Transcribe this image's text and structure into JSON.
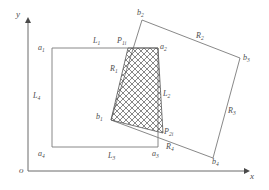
{
  "figure": {
    "type": "geometry-diagram",
    "colors": {
      "line": "#7a7a7a",
      "axis": "#6b6b6b",
      "hatch": "#555555",
      "label": "#4d4d4d",
      "background": "#ffffff"
    }
  },
  "axes": {
    "origin_label": "o",
    "x_label": "x",
    "y_label": "y"
  },
  "rect_a": {
    "name": "axis-aligned-rectangle",
    "vertices": [
      {
        "id": "a1",
        "label": "a",
        "sub": "1",
        "x": 52,
        "y": 48
      },
      {
        "id": "a2",
        "label": "a",
        "sub": "2",
        "x": 158,
        "y": 48
      },
      {
        "id": "a3",
        "label": "a",
        "sub": "3",
        "x": 158,
        "y": 147
      },
      {
        "id": "a4",
        "label": "a",
        "sub": "4",
        "x": 52,
        "y": 147
      }
    ],
    "edges": [
      {
        "id": "L1",
        "label": "L",
        "sub": "1"
      },
      {
        "id": "L2",
        "label": "L",
        "sub": "2"
      },
      {
        "id": "L3",
        "label": "L",
        "sub": "3"
      },
      {
        "id": "L4",
        "label": "L",
        "sub": "4"
      }
    ]
  },
  "rect_b": {
    "name": "rotated-rectangle",
    "vertices": [
      {
        "id": "b1",
        "label": "b",
        "sub": "1",
        "x": 111,
        "y": 120
      },
      {
        "id": "b2",
        "label": "b",
        "sub": "2",
        "x": 142,
        "y": 20
      },
      {
        "id": "b3",
        "label": "b",
        "sub": "3",
        "x": 240,
        "y": 58
      },
      {
        "id": "b4",
        "label": "b",
        "sub": "4",
        "x": 213,
        "y": 158
      }
    ],
    "edges": [
      {
        "id": "R1",
        "label": "R",
        "sub": "1"
      },
      {
        "id": "R2",
        "label": "R",
        "sub": "2"
      },
      {
        "id": "R3",
        "label": "R",
        "sub": "3"
      },
      {
        "id": "R4",
        "label": "R",
        "sub": "4"
      }
    ]
  },
  "intersection_points": [
    {
      "id": "P1i",
      "label": "P",
      "sub": "1i",
      "x": 128,
      "y": 48
    },
    {
      "id": "P2i",
      "label": "P",
      "sub": "2i",
      "x": 163,
      "y": 133
    }
  ],
  "overlap_region": {
    "name": "hatched-overlap-polygon",
    "vertices": [
      {
        "x": 128,
        "y": 48
      },
      {
        "x": 158,
        "y": 48
      },
      {
        "x": 163,
        "y": 133
      },
      {
        "x": 111,
        "y": 120
      }
    ]
  },
  "labels": {
    "a1": "a",
    "a1_sub": "1",
    "a2": "a",
    "a2_sub": "2",
    "a3": "a",
    "a3_sub": "3",
    "a4": "a",
    "a4_sub": "4",
    "b1": "b",
    "b1_sub": "1",
    "b2": "b",
    "b2_sub": "2",
    "b3": "b",
    "b3_sub": "3",
    "b4": "b",
    "b4_sub": "4",
    "L1": "L",
    "L1_sub": "1",
    "L2": "L",
    "L2_sub": "2",
    "L3": "L",
    "L3_sub": "3",
    "L4": "L",
    "L4_sub": "4",
    "R1": "R",
    "R1_sub": "1",
    "R2": "R",
    "R2_sub": "2",
    "R3": "R",
    "R3_sub": "3",
    "R4": "R",
    "R4_sub": "4",
    "P1": "P",
    "P1_sub": "1i",
    "P2": "P",
    "P2_sub": "2i",
    "origin": "o",
    "x_axis": "x",
    "y_axis": "y"
  }
}
